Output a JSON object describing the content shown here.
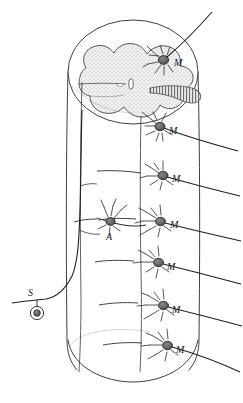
{
  "figure": {
    "background_color": "#ffffff",
    "ink_color": "#1a1a1a",
    "gray_matter_fill": "#efefef",
    "soma_fill": "#6f6f6f",
    "width": 243,
    "height": 403
  },
  "labels": {
    "motor_1": "M",
    "motor_2": "M",
    "motor_3": "M",
    "motor_4": "M",
    "motor_5": "M",
    "motor_6": "M",
    "motor_7": "M",
    "association": "A",
    "sensory": "S"
  },
  "structures": {
    "cord_cylinder": "spinal-cord-cylinder",
    "gray_matter": "butterfly-gray-matter",
    "central_canal": "central-canal",
    "dorsal_root_entry_tract": "hatched-root-tract",
    "dorsal_root_ganglion": "ganglion-cell-circle",
    "ventral_roots": [
      "motor-axon-1",
      "motor-axon-2",
      "motor-axon-3",
      "motor-axon-4",
      "motor-axon-5",
      "motor-axon-6",
      "motor-axon-7"
    ],
    "neurons": [
      {
        "name": "motor-neuron-1",
        "label": "M",
        "x": 166,
        "y": 62
      },
      {
        "name": "motor-neuron-2",
        "label": "M",
        "x": 164,
        "y": 129
      },
      {
        "name": "motor-neuron-3",
        "label": "M",
        "x": 169,
        "y": 178
      },
      {
        "name": "motor-neuron-4",
        "label": "M",
        "x": 166,
        "y": 224
      },
      {
        "name": "motor-neuron-5",
        "label": "M",
        "x": 163,
        "y": 265
      },
      {
        "name": "motor-neuron-6",
        "label": "M",
        "x": 168,
        "y": 308
      },
      {
        "name": "motor-neuron-7",
        "label": "M",
        "x": 172,
        "y": 348
      },
      {
        "name": "association-neuron",
        "label": "A",
        "x": 110,
        "y": 228
      },
      {
        "name": "sensory-ganglion-cell",
        "label": "S",
        "x": 33,
        "y": 295
      }
    ]
  }
}
